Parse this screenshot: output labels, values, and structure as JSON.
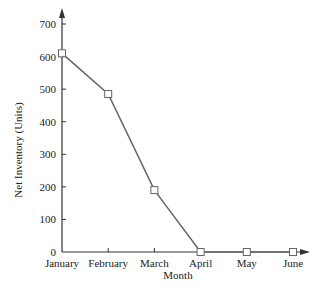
{
  "chart_data": {
    "type": "line",
    "title": "",
    "xlabel": "Month",
    "ylabel": "Net Inventory (Units)",
    "categories": [
      "January",
      "February",
      "March",
      "April",
      "May",
      "June"
    ],
    "series": [
      {
        "name": "Net Inventory",
        "values": [
          610,
          485,
          190,
          0,
          0,
          0
        ]
      }
    ],
    "ylim": [
      0,
      700
    ],
    "yticks": [
      0,
      100,
      200,
      300,
      400,
      500,
      600,
      700
    ],
    "grid": false,
    "legend": "none",
    "marker": "open-square",
    "colors": {
      "line": "#666666",
      "axis": "#333333",
      "marker_fill": "#ffffff"
    }
  }
}
